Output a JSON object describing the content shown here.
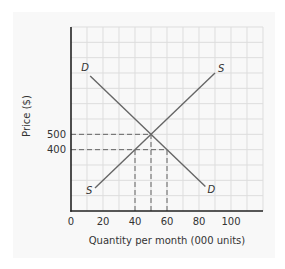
{
  "chart_data": {
    "type": "line",
    "title": "",
    "xlabel": "Quantity per month (000 units)",
    "ylabel": "Price ($)",
    "xlim": [
      0,
      120
    ],
    "ylim": [
      0,
      1200
    ],
    "grid": true,
    "x_ticks": [
      0,
      20,
      40,
      60,
      80,
      100
    ],
    "x_tick_labels": [
      "0",
      "20",
      "40",
      "60",
      "80",
      "100"
    ],
    "y_ticks": [
      400,
      500
    ],
    "y_tick_labels": [
      "400",
      "500"
    ],
    "series": [
      {
        "name": "S",
        "label_start": "S",
        "label_end": "S",
        "points": [
          [
            15,
            150
          ],
          [
            90,
            900
          ]
        ]
      },
      {
        "name": "D",
        "label_start": "D",
        "label_end": "D",
        "points": [
          [
            12,
            880
          ],
          [
            84,
            160
          ]
        ]
      }
    ],
    "reference_lines": [
      {
        "type": "horizontal-dashed",
        "y": 500,
        "x_from": 0,
        "x_to": 50
      },
      {
        "type": "horizontal-dashed",
        "y": 400,
        "x_from": 0,
        "x_to": 60
      },
      {
        "type": "vertical-dashed",
        "x": 40,
        "y_from": 0,
        "y_to": 400
      },
      {
        "type": "vertical-dashed",
        "x": 50,
        "y_from": 0,
        "y_to": 500
      },
      {
        "type": "vertical-dashed",
        "x": 60,
        "y_from": 0,
        "y_to": 400
      }
    ],
    "equilibrium": {
      "quantity": 50,
      "price": 500
    },
    "legend": "none"
  },
  "colors": {
    "axis": "#222222",
    "grid": "#dddddd",
    "curve": "#666666",
    "dashed": "#555555",
    "panel": "#f8f8f8"
  }
}
